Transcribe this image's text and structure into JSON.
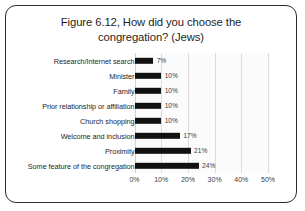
{
  "figure": {
    "title_line1": "Figure 6.12, How did you choose the",
    "title_line2": "congregation? (Jews)"
  },
  "axis": {
    "ticks": [
      "0%",
      "10%",
      "20%",
      "30%",
      "40%",
      "50%"
    ]
  },
  "bar_labels": [
    "7%",
    "10%",
    "10%",
    "10%",
    "10%",
    "17%",
    "21%",
    "24%"
  ],
  "categories": [
    "Research/Internet search",
    "Minister",
    "Family",
    "Prior relationship or affiliation",
    "Church shopping",
    "Welcome and inclusion",
    "Proximity",
    "Some feature of the congregation"
  ],
  "colors": {
    "bar": "#111111",
    "frame": "#2b2b2b",
    "gridline": "#dcdcdc",
    "plot_background": "#fbfbfb",
    "text": "#1f1f1f"
  },
  "chart_data": {
    "type": "bar",
    "orientation": "horizontal",
    "title": "Figure 6.12, How did you choose the congregation? (Jews)",
    "xlabel": "",
    "ylabel": "",
    "categories": [
      "Research/Internet search",
      "Minister",
      "Family",
      "Prior relationship or affiliation",
      "Church shopping",
      "Welcome and inclusion",
      "Proximity",
      "Some feature of the congregation"
    ],
    "values": [
      7,
      10,
      10,
      10,
      10,
      17,
      21,
      24
    ],
    "value_labels": [
      "7%",
      "10%",
      "10%",
      "10%",
      "10%",
      "17%",
      "21%",
      "24%"
    ],
    "unit": "%",
    "xlim": [
      0,
      52.5
    ],
    "xticks": [
      0,
      10,
      20,
      30,
      40,
      50
    ],
    "xtick_labels": [
      "0%",
      "10%",
      "20%",
      "30%",
      "40%",
      "50%"
    ],
    "grid": "vertical",
    "legend": "none",
    "series": [
      {
        "name": "Percent of respondents",
        "values": [
          7,
          10,
          10,
          10,
          10,
          17,
          21,
          24
        ]
      }
    ]
  }
}
